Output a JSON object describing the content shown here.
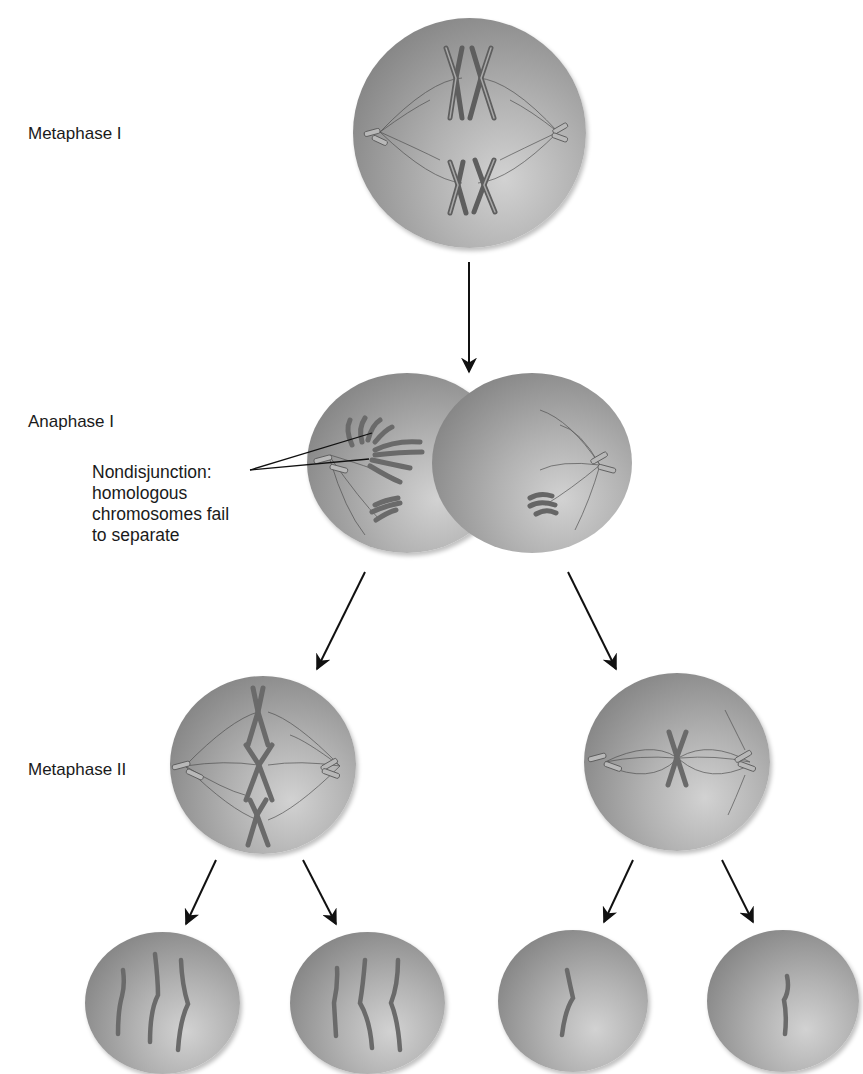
{
  "diagram": {
    "stages": [
      {
        "id": "metaphase-1",
        "label": "Metaphase I"
      },
      {
        "id": "anaphase-1",
        "label": "Anaphase I"
      },
      {
        "id": "metaphase-2",
        "label": "Metaphase II"
      }
    ],
    "annotation": {
      "lines": [
        "Nondisjunction:",
        "homologous",
        "chromosomes fail",
        "to separate"
      ]
    },
    "gametes": [
      {
        "position": "far-left",
        "chromosome_count": 3
      },
      {
        "position": "center-left",
        "chromosome_count": 3
      },
      {
        "position": "center-right",
        "chromosome_count": 1
      },
      {
        "position": "far-right",
        "chromosome_count": 1
      }
    ],
    "colors": {
      "cell_dark": "#727272",
      "cell_light": "#d2d2d2",
      "chromosome": "#8a8a8a",
      "arrow": "#111111",
      "text": "#1a1a1a"
    }
  }
}
